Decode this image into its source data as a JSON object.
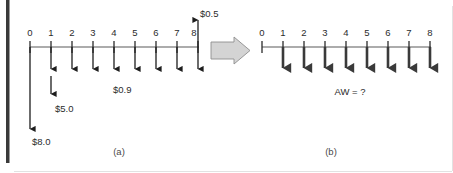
{
  "figure": {
    "panels": [
      {
        "id": "a",
        "caption": "(a)",
        "axis": {
          "tick_labels": [
            "0",
            "1",
            "2",
            "3",
            "4",
            "5",
            "6",
            "7",
            "8"
          ],
          "t_min": 0,
          "t_max": 8
        },
        "cash_flows": [
          {
            "t": 0,
            "direction": "down",
            "magnitude_label": "$8.0",
            "kind": "long"
          },
          {
            "t": 1,
            "direction": "down",
            "magnitude_label": "$5.0",
            "kind": "medium-split"
          },
          {
            "t": 2,
            "direction": "down",
            "magnitude_label": "",
            "kind": "short"
          },
          {
            "t": 3,
            "direction": "down",
            "magnitude_label": "",
            "kind": "short"
          },
          {
            "t": 4,
            "direction": "down",
            "magnitude_label": "$0.9",
            "kind": "short"
          },
          {
            "t": 5,
            "direction": "down",
            "magnitude_label": "",
            "kind": "short"
          },
          {
            "t": 6,
            "direction": "down",
            "magnitude_label": "",
            "kind": "short"
          },
          {
            "t": 7,
            "direction": "down",
            "magnitude_label": "",
            "kind": "short"
          },
          {
            "t": 8,
            "direction": "both",
            "magnitude_label": "$0.5",
            "kind": "double"
          }
        ],
        "labels": {
          "salvage": "$0.5",
          "annual_operating": "$0.9",
          "overhaul": "$5.0",
          "first_cost": "$8.0"
        }
      },
      {
        "id": "b",
        "caption": "(b)",
        "axis": {
          "tick_labels": [
            "0",
            "1",
            "2",
            "3",
            "4",
            "5",
            "6",
            "7",
            "8"
          ],
          "t_min": 0,
          "t_max": 8
        },
        "cash_flows": [
          {
            "t": 1,
            "direction": "down",
            "magnitude_label": "",
            "kind": "uniform"
          },
          {
            "t": 2,
            "direction": "down",
            "magnitude_label": "",
            "kind": "uniform"
          },
          {
            "t": 3,
            "direction": "down",
            "magnitude_label": "",
            "kind": "uniform"
          },
          {
            "t": 4,
            "direction": "down",
            "magnitude_label": "",
            "kind": "uniform"
          },
          {
            "t": 5,
            "direction": "down",
            "magnitude_label": "",
            "kind": "uniform"
          },
          {
            "t": 6,
            "direction": "down",
            "magnitude_label": "",
            "kind": "uniform"
          },
          {
            "t": 7,
            "direction": "down",
            "magnitude_label": "",
            "kind": "uniform"
          },
          {
            "t": 8,
            "direction": "down",
            "magnitude_label": "",
            "kind": "uniform"
          }
        ],
        "labels": {
          "annual_worth": "AW = ?"
        }
      }
    ],
    "transform_arrow": {
      "name": "right-block-arrow",
      "direction": "right"
    },
    "colors": {
      "ink": "#1d1d1d",
      "axis": "#5a5a5a",
      "thick_flow": "#3a3a3a",
      "block_arrow_fill": "#d4d4d4",
      "block_arrow_stroke": "#8f8f8f",
      "edge_bar": "#3a3a3a",
      "background": "#ffffff"
    }
  }
}
